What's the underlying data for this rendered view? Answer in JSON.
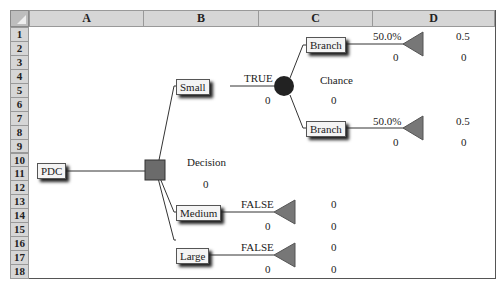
{
  "columns": [
    "A",
    "B",
    "C",
    "D"
  ],
  "rows": [
    "1",
    "2",
    "3",
    "4",
    "5",
    "6",
    "7",
    "8",
    "9",
    "10",
    "11",
    "12",
    "13",
    "14",
    "15",
    "16",
    "17",
    "18"
  ],
  "colors": {
    "decision_node": "#6b6b6b",
    "chance_node": "#222222",
    "terminal_node": "#777777",
    "header_bg": "#d6d6d6"
  },
  "tree": {
    "root": {
      "label": "PDC"
    },
    "decision": {
      "label": "Decision",
      "value": "0"
    },
    "branches": [
      {
        "label": "Small",
        "flag": "TRUE",
        "value": "0"
      },
      {
        "label": "Medium",
        "flag": "FALSE",
        "value": "0",
        "payoff": "0",
        "payoff_value": "0"
      },
      {
        "label": "Large",
        "flag": "FALSE",
        "value": "0",
        "payoff": "0",
        "payoff_value": "0"
      }
    ],
    "chance": {
      "label": "Chance",
      "value": "0"
    },
    "chance_branches": [
      {
        "label": "Branch",
        "prob": "50.0%",
        "value": "0",
        "payoff": "0.5",
        "payoff_value": "0"
      },
      {
        "label": "Branch",
        "prob": "50.0%",
        "value": "0",
        "payoff": "0.5",
        "payoff_value": "0"
      }
    ]
  }
}
